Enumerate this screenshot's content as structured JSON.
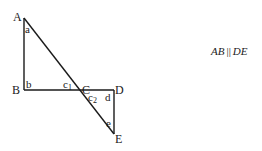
{
  "diagram": {
    "type": "geometry",
    "points": {
      "A": {
        "label": "A",
        "x": 24,
        "y": 18
      },
      "B": {
        "label": "B",
        "x": 24,
        "y": 90
      },
      "C": {
        "label": "C",
        "x": 81,
        "y": 90
      },
      "D": {
        "label": "D",
        "x": 114,
        "y": 90
      },
      "E": {
        "label": "E",
        "x": 114,
        "y": 134
      }
    },
    "segments": [
      [
        "A",
        "B"
      ],
      [
        "B",
        "D"
      ],
      [
        "D",
        "E"
      ],
      [
        "A",
        "E"
      ]
    ],
    "angles": {
      "a": "a",
      "b": "b",
      "c1_base": "c",
      "c1_sub": "1",
      "c2_base": "c",
      "c2_sub": "2",
      "d": "d",
      "e": "e"
    },
    "annotation": {
      "left": "AB",
      "parallel": "||",
      "right": "DE"
    },
    "stroke_color": "#1a1a1a"
  }
}
